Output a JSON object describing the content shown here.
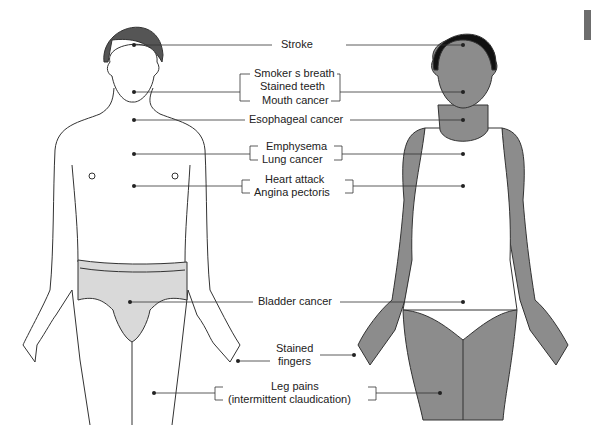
{
  "figure": {
    "colors": {
      "hair_male": "#555555",
      "hair_female": "#111111",
      "skin_female": "#8c8c8c",
      "underwear": "#d9d9d9",
      "line": "#333333",
      "tab": "#6d6d6d"
    },
    "labels": {
      "stroke": "Stroke",
      "smokers_breath": "Smoker s breath",
      "stained_teeth": "Stained teeth",
      "mouth_cancer": "Mouth cancer",
      "esophageal_cancer": "Esophageal cancer",
      "emphysema": "Emphysema",
      "lung_cancer": "Lung cancer",
      "heart_attack": "Heart attack",
      "angina_pectoris": "Angina pectoris",
      "bladder_cancer": "Bladder cancer",
      "stained": "Stained",
      "fingers": "fingers",
      "leg_pains": "Leg pains",
      "claudication": "(intermittent claudication)"
    }
  }
}
